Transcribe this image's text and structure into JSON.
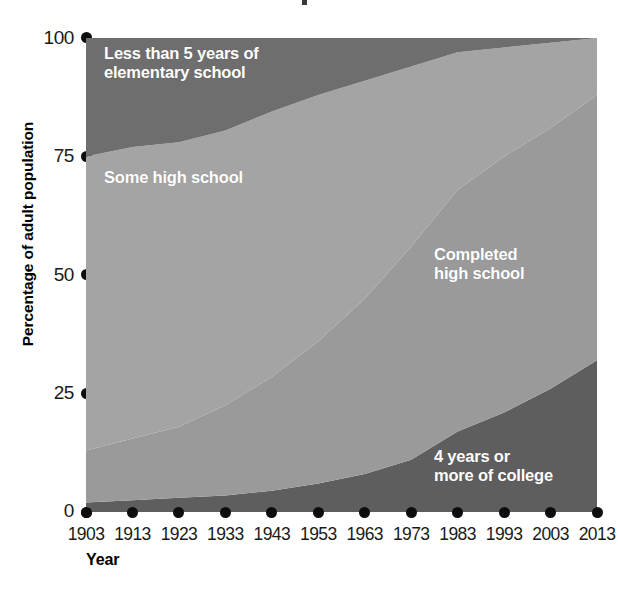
{
  "chart_data": {
    "type": "area",
    "stacked": true,
    "title": "",
    "xlabel": "Year",
    "ylabel": "Percentage of adult population",
    "x": [
      1903,
      1913,
      1923,
      1933,
      1943,
      1953,
      1963,
      1973,
      1983,
      1993,
      2003,
      2013
    ],
    "xtick_labels": [
      "1903",
      "1913",
      "1923",
      "1933",
      "1943",
      "1953",
      "1963",
      "1973",
      "1983",
      "1993",
      "2003",
      "2013"
    ],
    "ytick_labels": [
      "0",
      "25",
      "50",
      "75",
      "100"
    ],
    "yticks": [
      0,
      25,
      50,
      75,
      100
    ],
    "ylim": [
      0,
      100
    ],
    "xlim": [
      1903,
      2013
    ],
    "grid": false,
    "legend_position": "inline-band-labels",
    "series": [
      {
        "name": "4 years or more of college",
        "color": "#5e5e5e",
        "values": [
          2,
          2.5,
          3,
          3.5,
          4.5,
          6,
          8,
          11,
          17,
          21,
          26,
          32
        ]
      },
      {
        "name": "Completed high school",
        "color": "#9a9a9a",
        "values": [
          11,
          13,
          15,
          19,
          24,
          30,
          37,
          45,
          51,
          54,
          55,
          56
        ]
      },
      {
        "name": "Some high school",
        "color": "#a4a4a4",
        "values": [
          62,
          61,
          60,
          58,
          56,
          52,
          46,
          38,
          29,
          23,
          18,
          12
        ]
      },
      {
        "name": "Less than 5 years of elementary school",
        "color": "#6e6e6e",
        "values": [
          25,
          23.5,
          22,
          19.5,
          15.5,
          12,
          9,
          6,
          3,
          2,
          1,
          0
        ]
      }
    ],
    "cumulative_boundaries": {
      "note": "stack tops as percentage of adult population, bottom to top",
      "college_top": [
        2,
        2.5,
        3,
        3.5,
        4.5,
        6,
        8,
        11,
        17,
        21,
        26,
        32
      ],
      "completed_top": [
        13,
        15.5,
        18,
        22.5,
        28.5,
        36,
        45,
        56,
        68,
        75,
        81,
        88
      ],
      "somehs_top": [
        75,
        77,
        78,
        80.5,
        84.5,
        88,
        91,
        94,
        97,
        98,
        99,
        100
      ]
    },
    "band_labels": [
      {
        "id": "elementary",
        "text": "Less than 5 years of\nelementary school"
      },
      {
        "id": "some_high_school",
        "text": "Some high school"
      },
      {
        "id": "completed_high_school",
        "text": "Completed\nhigh school"
      },
      {
        "id": "college",
        "text": "4 years or\nmore of college"
      }
    ]
  },
  "axes": {
    "y_title": "Percentage of adult population",
    "x_title": "Year",
    "y_ticks": [
      "100",
      "75",
      "50",
      "25",
      "0"
    ],
    "x_ticks": [
      "1903",
      "1913",
      "1923",
      "1933",
      "1943",
      "1953",
      "1963",
      "1973",
      "1983",
      "1993",
      "2003",
      "2013"
    ]
  },
  "labels": {
    "elementary": "Less than 5 years of\nelementary school",
    "some_high_school": "Some high school",
    "completed_high_school": "Completed\nhigh school",
    "college": "4 years or\nmore of college"
  },
  "colors": {
    "elementary": "#6e6e6e",
    "some_high_school": "#a4a4a4",
    "completed_high_school": "#9a9a9a",
    "college": "#5e5e5e",
    "axis": "#0d0d0d",
    "background": "#ffffff"
  }
}
